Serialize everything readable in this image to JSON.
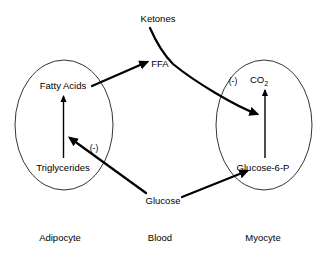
{
  "diagram": {
    "colors": {
      "background": "#ffffff",
      "stroke": "#000000",
      "text": "#000000"
    },
    "compartments": [
      {
        "id": "adipocyte",
        "label": "Adipocyte"
      },
      {
        "id": "blood",
        "label": "Blood"
      },
      {
        "id": "myocyte",
        "label": "Myocyte"
      }
    ],
    "nodes": [
      {
        "id": "ketones",
        "label": "Ketones",
        "compartment": "blood"
      },
      {
        "id": "ffa",
        "label": "FFA",
        "compartment": "blood"
      },
      {
        "id": "glucose",
        "label": "Glucose",
        "compartment": "blood"
      },
      {
        "id": "fatty_acids",
        "label": "Fatty Acids",
        "compartment": "adipocyte"
      },
      {
        "id": "triglycerides",
        "label": "Triglycerides",
        "compartment": "adipocyte"
      },
      {
        "id": "co2",
        "label": "CO",
        "subscript": "2",
        "compartment": "myocyte"
      },
      {
        "id": "glucose_6_p",
        "label": "Glucose-6-P",
        "compartment": "myocyte"
      }
    ],
    "edges": [
      {
        "id": "tg-to-fa",
        "from": "triglycerides",
        "to": "fatty_acids",
        "style": "thin",
        "kind": "conversion"
      },
      {
        "id": "fa-to-ffa",
        "from": "fatty_acids",
        "to": "ffa",
        "style": "thick",
        "kind": "transport"
      },
      {
        "id": "g6p-to-co2",
        "from": "glucose_6_p",
        "to": "co2",
        "style": "thin",
        "kind": "conversion"
      },
      {
        "id": "glucose-to-g6p",
        "from": "glucose",
        "to": "glucose_6_p",
        "style": "thick",
        "kind": "transport"
      },
      {
        "id": "glucose-inhibits-lipolysis",
        "from": "glucose",
        "to": "tg-to-fa",
        "style": "thick",
        "kind": "inhibition"
      },
      {
        "id": "ketones-inhibit-oxidation",
        "from": "ketones",
        "to": "g6p-to-co2",
        "style": "thick",
        "kind": "inhibition"
      }
    ],
    "sign_labels": [
      {
        "id": "sign-adipocyte",
        "label": "(-)",
        "for_edge": "glucose-inhibits-lipolysis"
      },
      {
        "id": "sign-myocyte",
        "label": "(-)",
        "for_edge": "ketones-inhibit-oxidation"
      }
    ]
  }
}
